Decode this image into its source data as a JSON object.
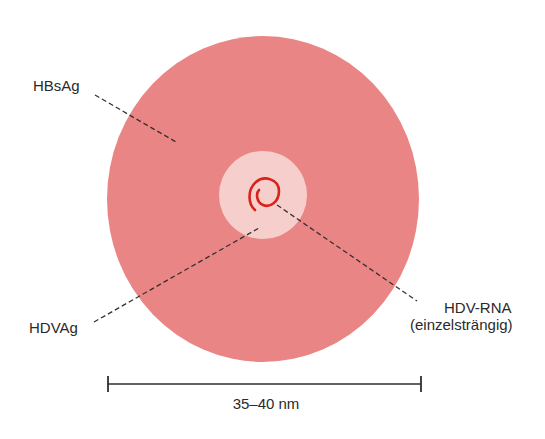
{
  "figure": {
    "type": "schematic virus particle diagram",
    "colors": {
      "envelope": "#ea8585",
      "core": "#f6cfcc",
      "rna": "#d8231a",
      "leader_lines": "#3a3030",
      "scale_bar": "#2e2e2e",
      "background": "#ffffff"
    }
  },
  "labels": {
    "hbsag": "HBsAg",
    "hdvag": "HDVAg",
    "hdv_rna_line1": "HDV-RNA",
    "hdv_rna_line2": "(einzelsträngig)"
  },
  "scale_bar": {
    "label": "35–40 nm"
  }
}
